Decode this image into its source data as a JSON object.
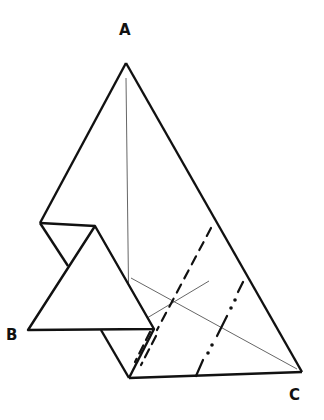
{
  "diagram": {
    "type": "origami-fold-diagram",
    "labels": {
      "top_point": "A",
      "left_point": "B",
      "right_point": "C"
    },
    "colors": {
      "line": "#111111",
      "crease": "#555555",
      "paper": "#ffffff"
    },
    "fold_lines": [
      {
        "kind": "valley-fold",
        "style": "dashed"
      },
      {
        "kind": "mountain-fold",
        "style": "dash-dot-dot"
      }
    ]
  }
}
